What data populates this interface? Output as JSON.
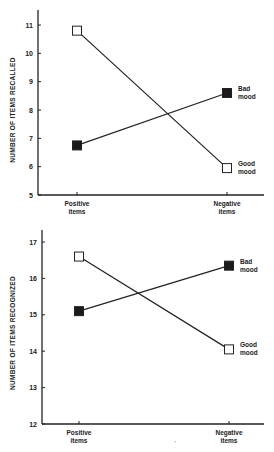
{
  "chart_data": [
    {
      "type": "line",
      "title": "",
      "xlabel": "",
      "ylabel": "NUMBER OF ITEMS RECALLED",
      "categories": [
        "Positive items",
        "Negative items"
      ],
      "category_lines": [
        [
          "Positive",
          "items"
        ],
        [
          "Negative",
          "items"
        ]
      ],
      "ylim": [
        5,
        11
      ],
      "yticks": [
        5,
        6,
        7,
        8,
        9,
        10,
        11
      ],
      "grid": false,
      "legend_position": "inline-right",
      "series": [
        {
          "name": "Bad mood",
          "label_lines": [
            "Bad",
            "mood"
          ],
          "marker": "filled-square",
          "values": [
            6.75,
            8.6
          ]
        },
        {
          "name": "Good mood",
          "label_lines": [
            "Good",
            "mood"
          ],
          "marker": "open-square",
          "values": [
            10.8,
            5.95
          ]
        }
      ]
    },
    {
      "type": "line",
      "title": "",
      "xlabel": "",
      "ylabel": "NUMBER OF ITEMS RECOGNIZED",
      "categories": [
        "Positive items",
        "Negative items"
      ],
      "category_lines": [
        [
          "Positive",
          "items"
        ],
        [
          "Negative",
          "items"
        ]
      ],
      "ylim": [
        12,
        17
      ],
      "yticks": [
        12,
        13,
        14,
        15,
        16,
        17
      ],
      "grid": false,
      "legend_position": "inline-right",
      "series": [
        {
          "name": "Bad mood",
          "label_lines": [
            "Bad",
            "mood"
          ],
          "marker": "filled-square",
          "values": [
            15.1,
            16.35
          ]
        },
        {
          "name": "Good mood",
          "label_lines": [
            "Good",
            "mood"
          ],
          "marker": "open-square",
          "values": [
            16.6,
            14.05
          ]
        }
      ]
    }
  ],
  "colors": {
    "line": "#222222",
    "filled_marker": "#1a1a1a",
    "open_marker_fill": "#ffffff",
    "background": "#ffffff"
  }
}
